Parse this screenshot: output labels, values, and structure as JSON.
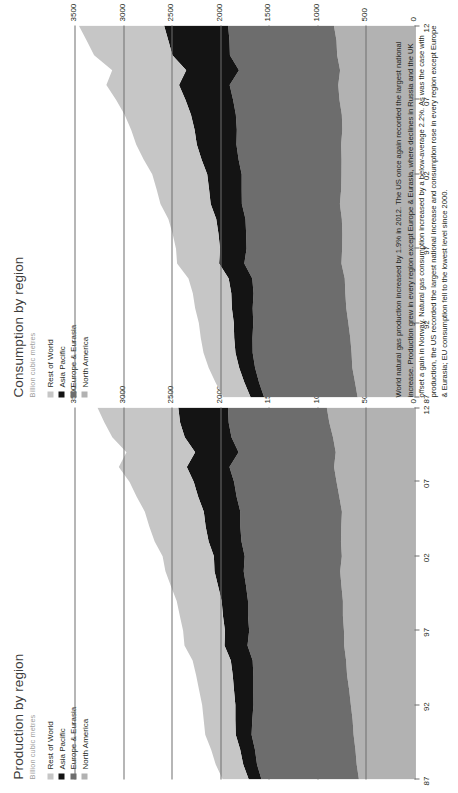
{
  "page": {
    "caption": "World natural gas production increased by 1.9% in 2012. The US once again recorded the largest national increase. Production grew in every region except Europe & Eurasia, where declines in Russia and the UK offset a gain in Norway. Natural gas consumption increased by a below-average 2.2%. As was the case with production, the US recorded the largest national increase and consumption rose in every region except Europe & Eurasia; EU consumption fell to the lowest level since 2000."
  },
  "colors": {
    "rest_of_world": "#c6c6c6",
    "asia_pacific": "#141414",
    "europe_eurasia": "#6d6d6d",
    "north_america": "#b2b2b2",
    "axis": "#6f6f6e",
    "title": "#3c3c3b",
    "subtitle": "#9d9d9c",
    "text": "#231f20"
  },
  "legend": {
    "items": [
      {
        "label": "Rest of World",
        "color": "#c6c6c6"
      },
      {
        "label": "Asia Pacific",
        "color": "#141414"
      },
      {
        "label": "Europe & Eurasia",
        "color": "#6d6d6d"
      },
      {
        "label": "North America",
        "color": "#b2b2b2"
      }
    ]
  },
  "chart_data": [
    {
      "type": "area",
      "id": "production",
      "title": "Production by region",
      "subtitle": "Billion cubic metres",
      "xlabel": "",
      "ylabel": "Billion cubic metres",
      "ylim": [
        0,
        3500
      ],
      "yticks": [
        0,
        500,
        1000,
        1500,
        2000,
        2500,
        3000,
        3500
      ],
      "ytick_labels": [
        "0",
        "500",
        "1000",
        "1500",
        "2000",
        "2500",
        "3000",
        "3500"
      ],
      "grid": false,
      "legend_position": "top-left",
      "x": [
        1987,
        1988,
        1989,
        1990,
        1991,
        1992,
        1993,
        1994,
        1995,
        1996,
        1997,
        1998,
        1999,
        2000,
        2001,
        2002,
        2003,
        2004,
        2005,
        2006,
        2007,
        2008,
        2009,
        2010,
        2011,
        2012
      ],
      "xticks": [
        1987,
        1992,
        1997,
        2002,
        2007,
        2012
      ],
      "xtick_labels": [
        "87",
        "92",
        "97",
        "02",
        "07",
        "12"
      ],
      "stack_order": [
        "North America",
        "Europe & Eurasia",
        "Asia Pacific",
        "Rest of World"
      ],
      "series": [
        {
          "name": "North America",
          "color": "#b2b2b2",
          "values": [
            572,
            595,
            608,
            627,
            637,
            655,
            672,
            694,
            704,
            724,
            726,
            737,
            737,
            752,
            765,
            748,
            757,
            754,
            747,
            774,
            802,
            828,
            811,
            839,
            877,
            903
          ]
        },
        {
          "name": "Europe & Eurasia",
          "color": "#6d6d6d",
          "values": [
            1003,
            1026,
            1034,
            1050,
            1033,
            1003,
            987,
            965,
            962,
            995,
            976,
            977,
            977,
            982,
            993,
            1000,
            1024,
            1039,
            1046,
            1057,
            1055,
            1077,
            1000,
            1045,
            1036,
            1017
          ]
        },
        {
          "name": "Asia Pacific",
          "color": "#141414",
          "values": [
            131,
            142,
            152,
            163,
            174,
            186,
            199,
            212,
            225,
            237,
            249,
            258,
            271,
            288,
            301,
            317,
            338,
            357,
            376,
            396,
            415,
            439,
            447,
            481,
            500,
            512
          ]
        },
        {
          "name": "Rest of World",
          "color": "#c6c6c6",
          "values": [
            268,
            283,
            299,
            314,
            326,
            342,
            359,
            377,
            393,
            412,
            431,
            444,
            463,
            486,
            505,
            528,
            556,
            580,
            607,
            633,
            661,
            700,
            707,
            746,
            779,
            832
          ]
        }
      ],
      "totals": [
        1974,
        2046,
        2093,
        2154,
        2170,
        2186,
        2217,
        2248,
        2284,
        2368,
        2382,
        2416,
        2448,
        2508,
        2564,
        2593,
        2675,
        2730,
        2776,
        2860,
        2933,
        3044,
        2965,
        3111,
        3192,
        3264
      ]
    },
    {
      "type": "area",
      "id": "consumption",
      "title": "Consumption by region",
      "subtitle": "Billion cubic metres",
      "xlabel": "",
      "ylabel": "Billion cubic metres",
      "ylim": [
        0,
        3500
      ],
      "yticks": [
        0,
        500,
        1000,
        1500,
        2000,
        2500,
        3000,
        3500
      ],
      "ytick_labels": [
        "0",
        "500",
        "1000",
        "1500",
        "2000",
        "2500",
        "3000",
        "3500"
      ],
      "grid": false,
      "legend_position": "top-left",
      "x": [
        1987,
        1988,
        1989,
        1990,
        1991,
        1992,
        1993,
        1994,
        1995,
        1996,
        1997,
        1998,
        1999,
        2000,
        2001,
        2002,
        2003,
        2004,
        2005,
        2006,
        2007,
        2008,
        2009,
        2010,
        2011,
        2012
      ],
      "xticks": [
        1987,
        1992,
        1997,
        2002,
        2007,
        2012
      ],
      "xtick_labels": [
        "87",
        "92",
        "97",
        "02",
        "07",
        "12"
      ],
      "stack_order": [
        "North America",
        "Europe & Eurasia",
        "Asia Pacific",
        "Rest of World"
      ],
      "series": [
        {
          "name": "North America",
          "color": "#b2b2b2",
          "values": [
            585,
            612,
            640,
            648,
            661,
            681,
            702,
            712,
            718,
            752,
            745,
            743,
            748,
            768,
            755,
            752,
            751,
            755,
            743,
            748,
            772,
            785,
            766,
            796,
            803,
            830
          ]
        },
        {
          "name": "Europe & Eurasia",
          "color": "#6d6d6d",
          "values": [
            962,
            988,
            1001,
            1018,
            1007,
            979,
            964,
            945,
            952,
            1000,
            984,
            990,
            992,
            1009,
            1024,
            1027,
            1060,
            1078,
            1086,
            1091,
            1095,
            1118,
            1041,
            1104,
            1102,
            1089
          ]
        },
        {
          "name": "Asia Pacific",
          "color": "#141414",
          "values": [
            139,
            151,
            164,
            177,
            188,
            200,
            214,
            229,
            243,
            259,
            273,
            285,
            301,
            321,
            336,
            355,
            381,
            408,
            435,
            462,
            490,
            521,
            543,
            592,
            629,
            659
          ]
        },
        {
          "name": "Rest of World",
          "color": "#c6c6c6",
          "values": [
            281,
            297,
            314,
            329,
            344,
            360,
            378,
            396,
            414,
            433,
            453,
            472,
            493,
            517,
            540,
            566,
            596,
            624,
            653,
            683,
            714,
            748,
            762,
            806,
            841,
            878
          ]
        }
      ],
      "totals": [
        1967,
        2048,
        2119,
        2172,
        2200,
        2220,
        2258,
        2282,
        2327,
        2444,
        2455,
        2490,
        2534,
        2615,
        2655,
        2700,
        2788,
        2865,
        2917,
        2984,
        3071,
        3172,
        3112,
        3298,
        3375,
        3456
      ]
    }
  ]
}
